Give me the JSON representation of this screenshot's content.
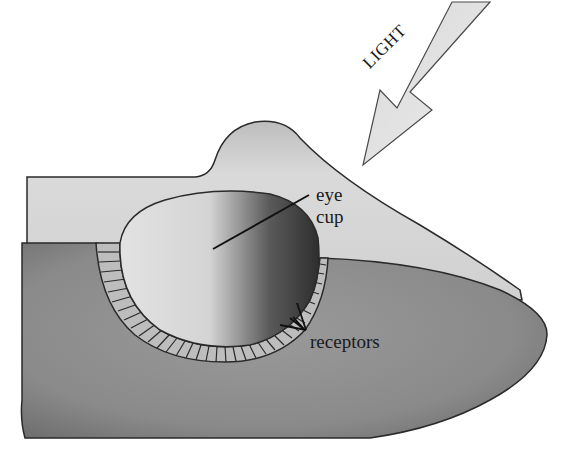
{
  "figure": {
    "labels": {
      "light": "LIGHT",
      "eye_cup_line1": "eye",
      "eye_cup_line2": "cup",
      "receptors": "receptors"
    },
    "parts": [
      {
        "id": "light-arrow",
        "description": "Arrow showing incoming light"
      },
      {
        "id": "body-top-surface",
        "description": "Light gray upper surface of the organism"
      },
      {
        "id": "body-cut-face",
        "description": "Darker gray cross-section face"
      },
      {
        "id": "eye-cup",
        "description": "Cup-shaped depression lined with receptors"
      },
      {
        "id": "receptor-layer",
        "description": "Segmented receptor cells lining the cup"
      }
    ],
    "colors": {
      "top_surface": "#d6d6d6",
      "cut_face": "#8c8c8c",
      "cup_light": "#dcdcdc",
      "cup_dark": "#3a3a3a",
      "receptor": "#bdbdbd",
      "outline": "#2a2a2a",
      "arrow_fill": "#e0e0e0"
    }
  }
}
